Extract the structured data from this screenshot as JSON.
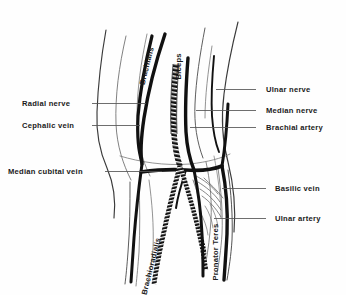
{
  "figure": {
    "background_color": "#fefefe",
    "ink_color": "#1a1a1a",
    "leader_color": "#555555",
    "width": 346,
    "height": 295
  },
  "labels": {
    "left": [
      {
        "name": "radial-nerve",
        "text": "Radial nerve",
        "x": 22,
        "y": 100,
        "leader_x1": 92,
        "leader_y1": 103,
        "leader_x2": 146,
        "leader_y2": 103
      },
      {
        "name": "cephalic-vein",
        "text": "Cephalic vein",
        "x": 22,
        "y": 122,
        "leader_x1": 92,
        "leader_y1": 125,
        "leader_x2": 140,
        "leader_y2": 125
      },
      {
        "name": "median-cubital-vein",
        "text": "Median cubital vein",
        "x": 8,
        "y": 168,
        "leader_x1": 105,
        "leader_y1": 171,
        "leader_x2": 162,
        "leader_y2": 171
      }
    ],
    "right": [
      {
        "name": "ulnar-nerve",
        "text": "Ulnar nerve",
        "x": 266,
        "y": 86,
        "leader_x1": 256,
        "leader_y1": 89,
        "leader_x2": 216,
        "leader_y2": 89
      },
      {
        "name": "median-nerve",
        "text": "Median nerve",
        "x": 266,
        "y": 107,
        "leader_x1": 256,
        "leader_y1": 110,
        "leader_x2": 196,
        "leader_y2": 110
      },
      {
        "name": "brachial-artery",
        "text": "Brachial artery",
        "x": 266,
        "y": 124,
        "leader_x1": 256,
        "leader_y1": 127,
        "leader_x2": 190,
        "leader_y2": 127
      },
      {
        "name": "basilic-vein",
        "text": "Basilic vein",
        "x": 275,
        "y": 185,
        "leader_x1": 266,
        "leader_y1": 188,
        "leader_x2": 222,
        "leader_y2": 188
      },
      {
        "name": "ulnar-artery",
        "text": "Ulnar artery",
        "x": 275,
        "y": 215,
        "leader_x1": 266,
        "leader_y1": 218,
        "leader_x2": 214,
        "leader_y2": 218
      }
    ],
    "rotated": [
      {
        "name": "brachialis",
        "text": "Brachialis",
        "x": 146,
        "y": 78,
        "rotation": -76
      },
      {
        "name": "biceps",
        "text": "Biceps",
        "x": 183,
        "y": 72,
        "rotation": -90
      },
      {
        "name": "brachioradialis",
        "text": "Brachioradialis",
        "x": 148,
        "y": 288,
        "rotation": -76
      },
      {
        "name": "pronator-teres",
        "text": "Pronator Teres",
        "x": 220,
        "y": 273,
        "rotation": -90
      }
    ]
  }
}
